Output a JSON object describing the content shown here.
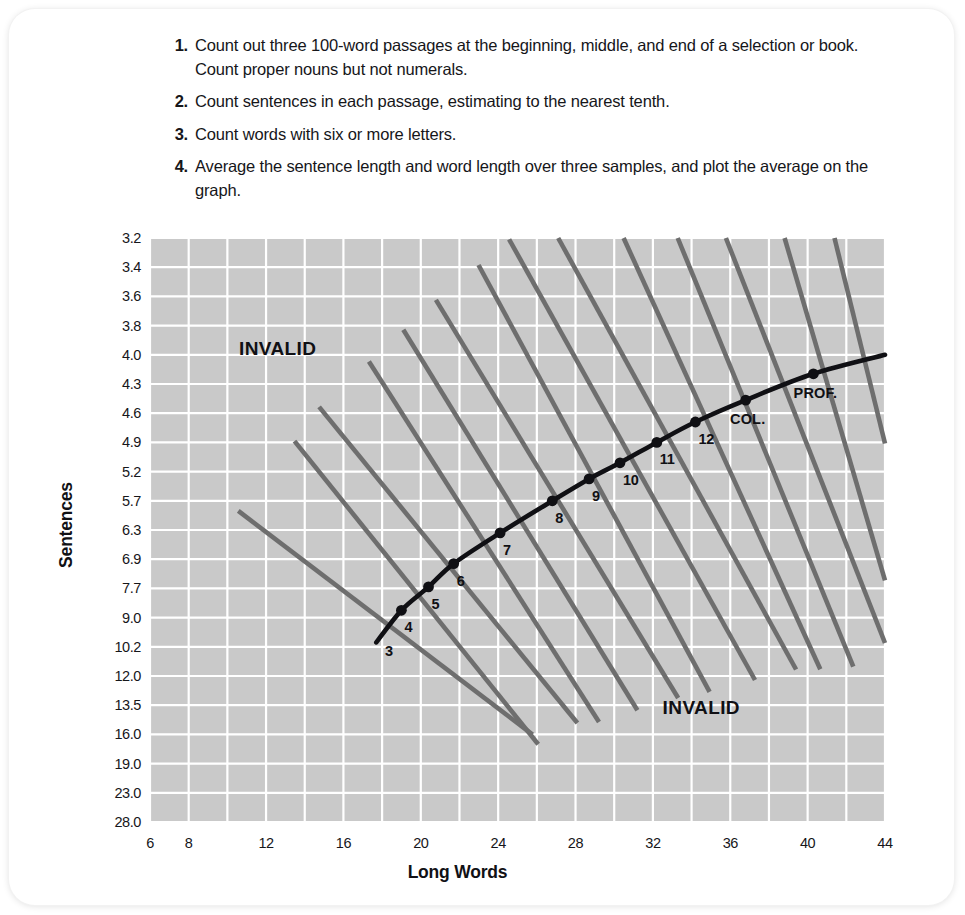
{
  "instructions": [
    {
      "num": "1.",
      "text": "Count out three 100-word passages at the beginning, middle, and end of a selection or book. Count proper nouns but not numerals."
    },
    {
      "num": "2.",
      "text": "Count sentences in each passage, estimating to the nearest tenth."
    },
    {
      "num": "3.",
      "text": "Count words with six or more letters."
    },
    {
      "num": "4.",
      "text": "Average the sentence length and word length over three samples, and plot the average on the graph."
    }
  ],
  "chart_data": {
    "type": "line",
    "title": "",
    "xlabel": "Long Words",
    "ylabel": "Sentences",
    "grid": true,
    "legend": "none",
    "xlim": [
      6,
      44
    ],
    "x_ticks": [
      6,
      8,
      12,
      16,
      20,
      24,
      28,
      32,
      36,
      40,
      44
    ],
    "x_tick_labels": [
      "6",
      "8",
      "12",
      "16",
      "20",
      "24",
      "28",
      "32",
      "36",
      "40",
      "44"
    ],
    "y_axis_type": "ordinal-nonlinear",
    "y_tick_labels": [
      "3.2",
      "3.4",
      "3.6",
      "3.8",
      "4.0",
      "4.3",
      "4.6",
      "4.9",
      "5.2",
      "5.7",
      "6.3",
      "6.9",
      "7.7",
      "9.0",
      "10.2",
      "12.0",
      "13.5",
      "16.0",
      "19.0",
      "23.0",
      "28.0"
    ],
    "annotations": [
      {
        "label": "INVALID",
        "x": 12.6,
        "y_index": 4.0
      },
      {
        "label": "INVALID",
        "x": 34.5,
        "y_index": 16.3
      }
    ],
    "grade_points": [
      {
        "label": "3",
        "x": 18.0,
        "y_index": 13.55,
        "dot": false
      },
      {
        "label": "4",
        "x": 19.0,
        "y_index": 12.75,
        "dot": true
      },
      {
        "label": "5",
        "x": 20.4,
        "y_index": 11.95,
        "dot": true
      },
      {
        "label": "6",
        "x": 21.7,
        "y_index": 11.15,
        "dot": true
      },
      {
        "label": "7",
        "x": 24.1,
        "y_index": 10.1,
        "dot": true
      },
      {
        "label": "8",
        "x": 26.8,
        "y_index": 9.0,
        "dot": true
      },
      {
        "label": "9",
        "x": 28.7,
        "y_index": 8.25,
        "dot": true
      },
      {
        "label": "10",
        "x": 30.3,
        "y_index": 7.7,
        "dot": true
      },
      {
        "label": "11",
        "x": 32.2,
        "y_index": 7.0,
        "dot": true
      },
      {
        "label": "12",
        "x": 34.2,
        "y_index": 6.3,
        "dot": true
      },
      {
        "label": "COL.",
        "x": 36.8,
        "y_index": 5.55,
        "dot": true
      },
      {
        "label": "PROF.",
        "x": 40.3,
        "y_index": 4.65,
        "dot": true
      }
    ],
    "grade_divider_lines": 14,
    "series": [
      {
        "name": "readability-curve",
        "description": "Fry readability grade-level curve",
        "points": [
          {
            "x": 17.7,
            "y_index": 13.85
          },
          {
            "x": 19.0,
            "y_index": 12.75
          },
          {
            "x": 20.4,
            "y_index": 11.95
          },
          {
            "x": 21.7,
            "y_index": 11.15
          },
          {
            "x": 24.1,
            "y_index": 10.1
          },
          {
            "x": 26.8,
            "y_index": 9.0
          },
          {
            "x": 28.7,
            "y_index": 8.25
          },
          {
            "x": 30.3,
            "y_index": 7.7
          },
          {
            "x": 32.2,
            "y_index": 7.0
          },
          {
            "x": 34.2,
            "y_index": 6.3
          },
          {
            "x": 36.8,
            "y_index": 5.55
          },
          {
            "x": 40.3,
            "y_index": 4.65
          },
          {
            "x": 44.0,
            "y_index": 4.0
          }
        ]
      }
    ]
  },
  "colors": {
    "plot_background": "#c9c9c9",
    "gridline": "#ffffff",
    "curve": "#101014",
    "divider_line": "#6e6e6e",
    "text": "#16161a",
    "page_background": "#ffffff"
  }
}
